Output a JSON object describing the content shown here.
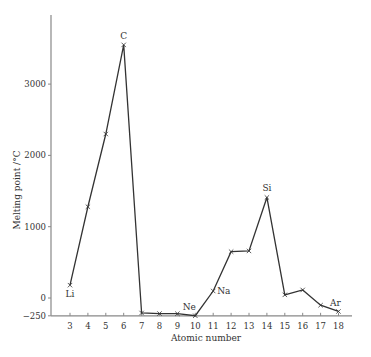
{
  "chart_data": {
    "type": "line",
    "title": "",
    "xlabel": "Atomic number",
    "ylabel": "Melting point /°C",
    "x": [
      3,
      4,
      5,
      6,
      7,
      8,
      9,
      10,
      11,
      12,
      13,
      14,
      15,
      16,
      17,
      18
    ],
    "series": [
      {
        "name": "Melting point",
        "values": [
          180,
          1280,
          2300,
          3550,
          -210,
          -218,
          -220,
          -249,
          98,
          650,
          660,
          1410,
          44,
          113,
          -101,
          -189
        ]
      }
    ],
    "point_labels": [
      {
        "x": 3,
        "label": "Li"
      },
      {
        "x": 6,
        "label": "C"
      },
      {
        "x": 10,
        "label": "Ne"
      },
      {
        "x": 11,
        "label": "Na"
      },
      {
        "x": 14,
        "label": "Si"
      },
      {
        "x": 18,
        "label": "Ar"
      }
    ],
    "x_ticks": [
      3,
      4,
      5,
      6,
      7,
      8,
      9,
      10,
      11,
      12,
      13,
      14,
      15,
      16,
      17,
      18
    ],
    "y_ticks": [
      -250,
      0,
      1000,
      2000,
      3000
    ],
    "xlim": [
      2,
      19
    ],
    "ylim": [
      -250,
      3900
    ],
    "grid": false,
    "legend": "none",
    "line_color": "#333333",
    "axis_color": "#888888"
  }
}
